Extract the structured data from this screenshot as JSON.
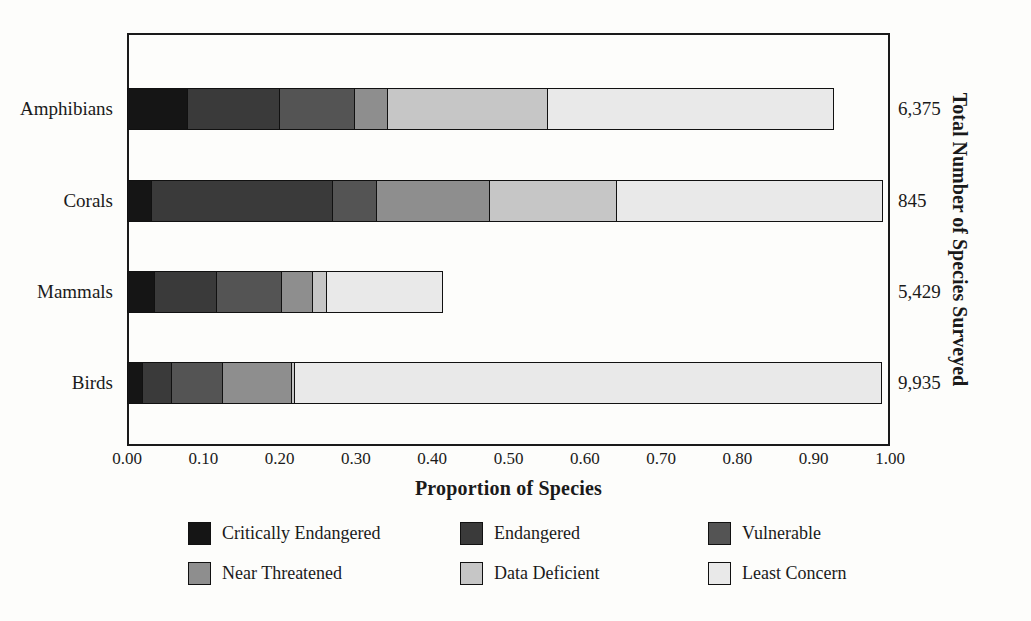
{
  "chart_data": {
    "type": "bar",
    "orientation": "horizontal",
    "stacked": true,
    "normalized": true,
    "title": "",
    "xlabel": "Proportion of Species",
    "ylabel": "Total Number of Species Surveyed",
    "xlim": [
      0.0,
      1.0
    ],
    "grid": false,
    "legend_position": "bottom",
    "xticks": [
      "0.00",
      "0.10",
      "0.20",
      "0.30",
      "0.40",
      "0.50",
      "0.60",
      "0.70",
      "0.80",
      "0.90",
      "1.00"
    ],
    "xtick_values": [
      0.0,
      0.1,
      0.2,
      0.3,
      0.4,
      0.5,
      0.6,
      0.7,
      0.8,
      0.9,
      1.0
    ],
    "categories": [
      "Amphibians",
      "Corals",
      "Mammals",
      "Birds"
    ],
    "category_totals": [
      "6,375",
      "845",
      "5,429",
      "9,935"
    ],
    "category_total_values": [
      6375,
      845,
      5429,
      9935
    ],
    "series": [
      {
        "name": "Critically Endangered",
        "color": "#151515",
        "values": [
          0.08,
          0.034,
          0.037,
          0.022
        ]
      },
      {
        "name": "Endangered",
        "color": "#3a3a3a",
        "values": [
          0.123,
          0.239,
          0.083,
          0.039
        ]
      },
      {
        "name": "Vulnerable",
        "color": "#545454",
        "values": [
          0.1,
          0.059,
          0.088,
          0.07
        ]
      },
      {
        "name": "Near Threatened",
        "color": "#8e8e8e",
        "values": [
          0.045,
          0.15,
          0.043,
          0.092
        ]
      },
      {
        "name": "Data Deficient",
        "color": "#c6c6c6",
        "values": [
          0.212,
          0.169,
          0.02,
          0.006
        ]
      },
      {
        "name": "Least Concern",
        "color": "#e9e9e9",
        "values": [
          0.376,
          0.35,
          0.153,
          0.771
        ]
      }
    ]
  },
  "axes": {
    "x_title": "Proportion of Species",
    "y_right_title": "Total Number of Species Surveyed"
  },
  "colors": {
    "frame": "#1a1a1a",
    "background": "#fdfdfb",
    "critically_endangered": "#151515",
    "endangered": "#3a3a3a",
    "vulnerable": "#545454",
    "near_threatened": "#8e8e8e",
    "data_deficient": "#c6c6c6",
    "least_concern": "#e9e9e9"
  }
}
